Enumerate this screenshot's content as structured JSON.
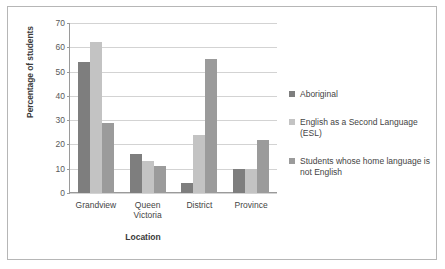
{
  "chart_data": {
    "type": "bar",
    "title": "",
    "subtitle": "",
    "xlabel": "Location",
    "ylabel": "Percentage of students",
    "categories": [
      "Grandview",
      "Queen\nVictoria",
      "District",
      "Province"
    ],
    "series": [
      {
        "name": "Aboriginal",
        "values": [
          54,
          16,
          4,
          10
        ],
        "color": "#7e7e7e"
      },
      {
        "name": "English as a Second Language (ESL)",
        "values": [
          62,
          13,
          24,
          10
        ],
        "color": "#c3c3c3"
      },
      {
        "name": "Students whose home language is not English",
        "values": [
          29,
          11,
          55,
          22
        ],
        "color": "#9b9b9b"
      }
    ],
    "ylim": [
      0,
      70
    ],
    "yticks": [
      0,
      10,
      20,
      30,
      40,
      50,
      60,
      70
    ],
    "ytick_labels": [
      "0",
      "10",
      "20",
      "30",
      "40",
      "50",
      "60",
      "70"
    ],
    "grid": true,
    "grid_axis": "y",
    "legend_position": "right",
    "legend": [
      {
        "label": "Aboriginal",
        "color": "#7e7e7e"
      },
      {
        "label": "English as a Second Language (ESL)",
        "color": "#c3c3c3"
      },
      {
        "label": "Students whose home language is not English",
        "color": "#9b9b9b"
      }
    ],
    "colors": {
      "border": "#b6b6b6",
      "gridline": "#d3d3d3",
      "axis": "#9a9a9a",
      "text": "#444444"
    }
  }
}
